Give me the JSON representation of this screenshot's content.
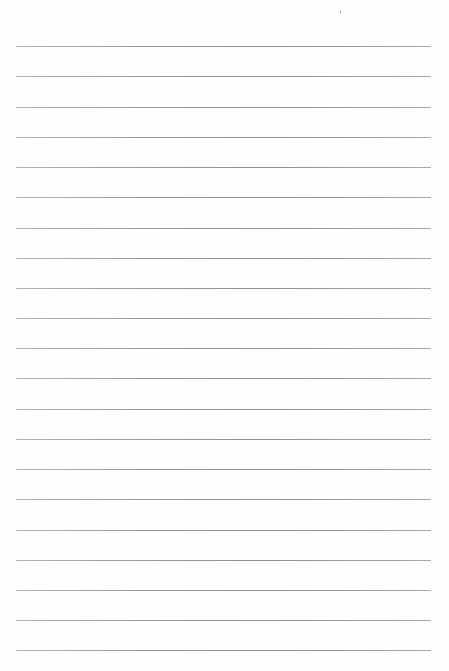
{
  "page": {
    "type": "ruled-paper",
    "background_color": "#fefefe",
    "rule_color": "#999999",
    "rule_count": 21,
    "rule_left": 16,
    "rule_right": 431,
    "first_rule_y": 46,
    "rule_spacing": 30.2,
    "rules_y": [
      46,
      76,
      107,
      137,
      167,
      197,
      228,
      258,
      288,
      318,
      348,
      378,
      409,
      439,
      469,
      499,
      530,
      560,
      590,
      620,
      650
    ]
  }
}
